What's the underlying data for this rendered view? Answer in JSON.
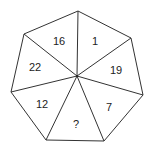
{
  "puzzle": {
    "shape": "heptagon",
    "line_color": "#333333",
    "text_color": "#222222",
    "background": "#ffffff",
    "center": {
      "x": 77,
      "y": 76
    },
    "vertices": [
      {
        "x": 78,
        "y": 11
      },
      {
        "x": 131,
        "y": 38
      },
      {
        "x": 143,
        "y": 95
      },
      {
        "x": 104,
        "y": 141
      },
      {
        "x": 46,
        "y": 140
      },
      {
        "x": 11,
        "y": 92
      },
      {
        "x": 24,
        "y": 34
      }
    ],
    "segments": [
      {
        "label": "1",
        "x": 95,
        "y": 41
      },
      {
        "label": "19",
        "x": 116,
        "y": 70
      },
      {
        "label": "7",
        "x": 109,
        "y": 107
      },
      {
        "label": "?",
        "x": 76,
        "y": 124
      },
      {
        "label": "12",
        "x": 42,
        "y": 104
      },
      {
        "label": "22",
        "x": 35,
        "y": 67
      },
      {
        "label": "16",
        "x": 59,
        "y": 41
      }
    ]
  }
}
